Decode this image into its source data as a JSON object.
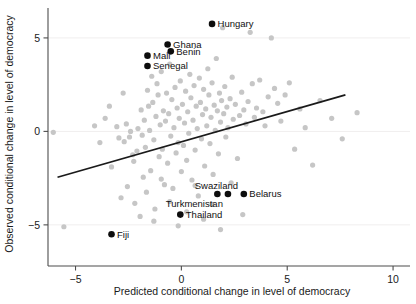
{
  "chart_data": {
    "type": "scatter",
    "title": "",
    "xlabel": "Predicted conditional change in level of democracy",
    "ylabel": "Observed conditional change in level of democracy",
    "xlim": [
      -6.3,
      10.8
    ],
    "ylim": [
      -7.2,
      6.6
    ],
    "xticks": [
      -5,
      0,
      5,
      10
    ],
    "xticklabels": [
      "−5",
      "0",
      "5",
      "10"
    ],
    "yticks": [
      -5,
      0,
      5
    ],
    "yticklabels": [
      "−5",
      "0",
      "5"
    ],
    "grid": "horizontal-gridlines-at-y-ticks",
    "legend": "none",
    "colors": {
      "unlabeled_point": "#c6c6c6",
      "labeled_point": "#0d0d0d",
      "fit_line": "#1a1a1a",
      "axis": "#4d4d4d",
      "gridline": "#f0eeee",
      "background": "#ffffff"
    },
    "fit_line": {
      "name": "linear fit",
      "x": [
        -5.85,
        7.75
      ],
      "y": [
        -2.45,
        1.95
      ]
    },
    "labeled_series": {
      "name": "Labeled countries",
      "marker": "filled-circle-black",
      "points": [
        {
          "label": "Hungary",
          "x": 1.45,
          "y": 5.75,
          "label_side": "right"
        },
        {
          "label": "Ghana",
          "x": -0.65,
          "y": 4.65,
          "label_side": "right"
        },
        {
          "label": "Benin",
          "x": -0.5,
          "y": 4.28,
          "label_side": "right"
        },
        {
          "label": "Mali",
          "x": -1.6,
          "y": 4.05,
          "label_side": "right"
        },
        {
          "label": "Senegal",
          "x": -1.6,
          "y": 3.5,
          "label_side": "right"
        },
        {
          "label": "Swaziland",
          "x": 1.7,
          "y": -3.35,
          "label_side": "above"
        },
        {
          "label": "Turkmenistan",
          "x": 2.2,
          "y": -3.35,
          "label_side": "below-left"
        },
        {
          "label": "Belarus",
          "x": 2.95,
          "y": -3.35,
          "label_side": "right"
        },
        {
          "label": "Thailand",
          "x": -0.05,
          "y": -4.45,
          "label_side": "right"
        },
        {
          "label": "Fiji",
          "x": -3.3,
          "y": -5.5,
          "label_side": "right"
        }
      ]
    },
    "unlabeled_series": {
      "name": "Other countries",
      "marker": "filled-circle-grey",
      "points": [
        [
          -6.05,
          -0.05
        ],
        [
          -5.55,
          -5.1
        ],
        [
          -3.05,
          0.25
        ],
        [
          -2.95,
          -0.35
        ],
        [
          -2.6,
          0.4
        ],
        [
          -2.7,
          -0.55
        ],
        [
          -2.45,
          -0.3
        ],
        [
          -2.4,
          0.0
        ],
        [
          -2.3,
          -1.25
        ],
        [
          -2.25,
          -1.6
        ],
        [
          -2.1,
          -1.05
        ],
        [
          -2.05,
          0.15
        ],
        [
          -1.9,
          1.15
        ],
        [
          -1.85,
          -0.2
        ],
        [
          -1.8,
          -2.45
        ],
        [
          -1.75,
          0.6
        ],
        [
          -1.7,
          -0.85
        ],
        [
          -1.6,
          2.2
        ],
        [
          -1.55,
          1.35
        ],
        [
          -1.5,
          0.05
        ],
        [
          -1.45,
          -2.1
        ],
        [
          -1.4,
          2.95
        ],
        [
          -1.35,
          1.55
        ],
        [
          -1.3,
          -0.45
        ],
        [
          -1.25,
          -4.15
        ],
        [
          -1.2,
          0.8
        ],
        [
          -1.15,
          2.55
        ],
        [
          -1.1,
          1.95
        ],
        [
          -1.05,
          -1.35
        ],
        [
          -1.0,
          0.35
        ],
        [
          -0.95,
          3.2
        ],
        [
          -0.9,
          -0.95
        ],
        [
          -0.85,
          1.1
        ],
        [
          -0.8,
          -2.85
        ],
        [
          -0.75,
          0.55
        ],
        [
          -0.7,
          2.05
        ],
        [
          -0.65,
          -1.7
        ],
        [
          -0.6,
          0.95
        ],
        [
          -0.55,
          3.6
        ],
        [
          -0.5,
          -0.25
        ],
        [
          -0.45,
          1.7
        ],
        [
          -0.4,
          -3.05
        ],
        [
          -0.35,
          0.2
        ],
        [
          -0.3,
          2.35
        ],
        [
          -0.25,
          -1.15
        ],
        [
          -0.2,
          1.25
        ],
        [
          -0.15,
          -0.6
        ],
        [
          -0.1,
          0.7
        ],
        [
          -0.05,
          2.7
        ],
        [
          0.0,
          -2.15
        ],
        [
          0.05,
          1.45
        ],
        [
          0.1,
          -0.75
        ],
        [
          0.15,
          0.45
        ],
        [
          0.2,
          2.15
        ],
        [
          0.25,
          -1.55
        ],
        [
          0.3,
          1.05
        ],
        [
          0.35,
          -0.1
        ],
        [
          0.4,
          3.05
        ],
        [
          0.45,
          1.8
        ],
        [
          0.5,
          -2.6
        ],
        [
          0.55,
          0.6
        ],
        [
          0.6,
          2.45
        ],
        [
          0.65,
          -1.0
        ],
        [
          0.7,
          1.35
        ],
        [
          0.75,
          0.15
        ],
        [
          0.8,
          -3.45
        ],
        [
          0.85,
          2.85
        ],
        [
          0.9,
          1.55
        ],
        [
          0.95,
          -0.4
        ],
        [
          1.0,
          0.9
        ],
        [
          1.05,
          2.25
        ],
        [
          1.1,
          -1.85
        ],
        [
          1.15,
          1.2
        ],
        [
          1.2,
          0.3
        ],
        [
          1.25,
          3.35
        ],
        [
          1.3,
          1.95
        ],
        [
          1.35,
          -0.65
        ],
        [
          1.4,
          0.75
        ],
        [
          1.45,
          2.6
        ],
        [
          1.5,
          -2.3
        ],
        [
          1.55,
          1.4
        ],
        [
          1.6,
          0.05
        ],
        [
          1.65,
          3.9
        ],
        [
          1.7,
          1.1
        ],
        [
          1.75,
          -1.2
        ],
        [
          1.8,
          2.05
        ],
        [
          1.85,
          0.5
        ],
        [
          1.9,
          1.65
        ],
        [
          1.95,
          5.55
        ],
        [
          2.0,
          0.95
        ],
        [
          2.05,
          2.4
        ],
        [
          2.1,
          -0.3
        ],
        [
          2.15,
          1.3
        ],
        [
          2.2,
          0.2
        ],
        [
          2.3,
          1.75
        ],
        [
          2.4,
          2.9
        ],
        [
          2.45,
          0.65
        ],
        [
          2.55,
          1.45
        ],
        [
          2.65,
          -1.45
        ],
        [
          2.75,
          0.85
        ],
        [
          2.85,
          2.1
        ],
        [
          2.95,
          1.15
        ],
        [
          3.05,
          0.4
        ],
        [
          3.15,
          1.6
        ],
        [
          3.25,
          5.3
        ],
        [
          3.35,
          2.55
        ],
        [
          3.45,
          0.75
        ],
        [
          3.55,
          1.25
        ],
        [
          3.7,
          2.75
        ],
        [
          3.85,
          1.05
        ],
        [
          3.95,
          0.3
        ],
        [
          4.1,
          1.85
        ],
        [
          4.25,
          5.0
        ],
        [
          4.4,
          2.3
        ],
        [
          4.55,
          1.5
        ],
        [
          4.7,
          0.55
        ],
        [
          4.9,
          1.95
        ],
        [
          5.1,
          2.6
        ],
        [
          5.35,
          -0.95
        ],
        [
          5.6,
          1.2
        ],
        [
          5.85,
          0.2
        ],
        [
          6.2,
          -1.8
        ],
        [
          6.55,
          1.65
        ],
        [
          7.1,
          0.7
        ],
        [
          7.6,
          -0.4
        ],
        [
          8.3,
          1.0
        ],
        [
          -2.85,
          -3.55
        ],
        [
          -2.55,
          -2.95
        ],
        [
          -2.2,
          -3.85
        ],
        [
          -1.95,
          -4.55
        ],
        [
          -1.65,
          -3.25
        ],
        [
          -1.3,
          -4.8
        ],
        [
          -0.95,
          -2.55
        ],
        [
          -0.55,
          -3.75
        ],
        [
          -0.15,
          -5.05
        ],
        [
          0.25,
          -4.3
        ],
        [
          0.65,
          -2.9
        ],
        [
          1.05,
          -4.7
        ],
        [
          1.45,
          -3.9
        ],
        [
          1.85,
          -5.25
        ],
        [
          2.35,
          -2.75
        ],
        [
          2.9,
          -4.45
        ],
        [
          -3.4,
          1.35
        ],
        [
          -3.3,
          -1.9
        ],
        [
          -3.6,
          0.7
        ],
        [
          -3.85,
          -0.6
        ],
        [
          -4.1,
          0.3
        ],
        [
          -2.75,
          2.05
        ]
      ]
    }
  },
  "axes": {
    "x_title": "Predicted conditional change in level of democracy",
    "y_title": "Observed conditional change in level of democracy",
    "x_tick_labels": [
      "−5",
      "0",
      "5",
      "10"
    ],
    "y_tick_labels": [
      "5",
      "0",
      "−5"
    ]
  }
}
